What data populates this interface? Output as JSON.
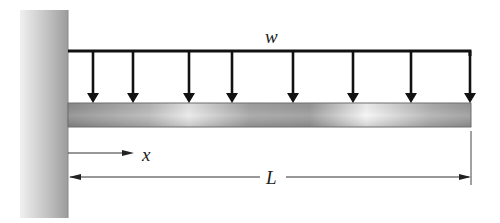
{
  "diagram": {
    "type": "cantilever-beam-uniform-load",
    "labels": {
      "load": "w",
      "position": "x",
      "length": "L"
    },
    "colors": {
      "wall_light": "#e6e6e6",
      "wall_dark": "#a8a8a8",
      "beam_dark": "#8f8f8f",
      "beam_light": "#f2f2f2",
      "line": "#111111"
    },
    "load_arrow_count": 8
  }
}
